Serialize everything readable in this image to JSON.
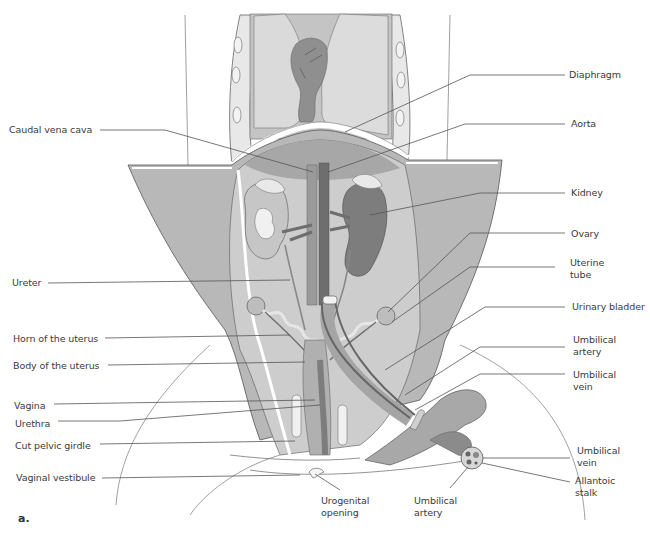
{
  "figure": {
    "panel_label": "a.",
    "colors": {
      "background": "#ffffff",
      "body_wall": "#b9b9b9",
      "cavity": "#cfcfcf",
      "lung": "#d9d9d9",
      "heart": "#8e8e8e",
      "aorta": "#6f6f6f",
      "vena_cava": "#9a9a9a",
      "kidney": "#7d7d7d",
      "leader_line": "#555555",
      "label_text": "#3a3a3a"
    }
  },
  "labels": {
    "left": [
      {
        "id": "caudal-vena-cava",
        "text": "Caudal vena cava"
      },
      {
        "id": "ureter",
        "text": "Ureter"
      },
      {
        "id": "horn-of-uterus",
        "text": "Horn of the uterus"
      },
      {
        "id": "body-of-uterus",
        "text": "Body of the uterus"
      },
      {
        "id": "vagina",
        "text": "Vagina"
      },
      {
        "id": "urethra",
        "text": "Urethra"
      },
      {
        "id": "cut-pelvic-girdle",
        "text": "Cut pelvic girdle"
      },
      {
        "id": "vaginal-vestibule",
        "text": "Vaginal vestibule"
      }
    ],
    "right": [
      {
        "id": "diaphragm",
        "text": "Diaphragm"
      },
      {
        "id": "aorta",
        "text": "Aorta"
      },
      {
        "id": "kidney",
        "text": "Kidney"
      },
      {
        "id": "ovary",
        "text": "Ovary"
      },
      {
        "id": "uterine-tube",
        "text": "Uterine tube"
      },
      {
        "id": "urinary-bladder",
        "text": "Urinary bladder"
      },
      {
        "id": "umbilical-artery",
        "text": "Umbilical artery"
      },
      {
        "id": "umbilical-vein",
        "text": "Umbilical vein"
      },
      {
        "id": "umbilical-vein-2",
        "text": "Umbilical vein"
      },
      {
        "id": "allantoic-stalk",
        "text": "Allantoic stalk"
      }
    ],
    "bottom": [
      {
        "id": "urogenital-opening",
        "text": "Urogenital opening"
      },
      {
        "id": "umbilical-artery-2",
        "text": "Umbilical artery"
      }
    ]
  }
}
